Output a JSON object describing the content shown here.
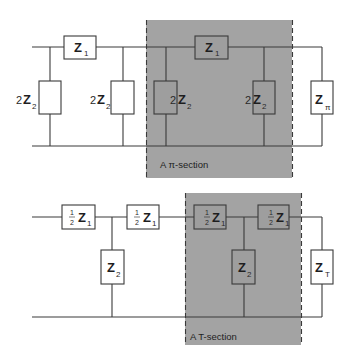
{
  "diagram": {
    "type": "circuit-ladder-network",
    "pi_network": {
      "section_caption": "A π-section",
      "series_elements": [
        {
          "main": "Z",
          "sub": "1"
        },
        {
          "main": "Z",
          "sub": "1"
        }
      ],
      "shunt_elements": [
        {
          "coef": "2",
          "main": "Z",
          "sub": "2"
        },
        {
          "coef": "2",
          "main": "Z",
          "sub": "2"
        },
        {
          "coef": "2",
          "main": "Z",
          "sub": "2"
        },
        {
          "coef": "2",
          "main": "Z",
          "sub": "2"
        }
      ],
      "termination": {
        "main": "Z",
        "sub": "π"
      }
    },
    "t_network": {
      "section_caption": "A  T-section",
      "series_elements": [
        {
          "frac_num": "1",
          "frac_den": "2",
          "main": "Z",
          "sub": "1"
        },
        {
          "frac_num": "1",
          "frac_den": "2",
          "main": "Z",
          "sub": "1"
        },
        {
          "frac_num": "1",
          "frac_den": "2",
          "main": "Z",
          "sub": "1"
        },
        {
          "frac_num": "1",
          "frac_den": "2",
          "main": "Z",
          "sub": "1"
        }
      ],
      "shunt_elements": [
        {
          "main": "Z",
          "sub": "2"
        },
        {
          "main": "Z",
          "sub": "2"
        }
      ],
      "termination": {
        "main": "Z",
        "sub": "T"
      }
    },
    "colors": {
      "highlight_region": "#a3a3a3",
      "line": "#3a3a3a",
      "background": "#ffffff"
    }
  }
}
